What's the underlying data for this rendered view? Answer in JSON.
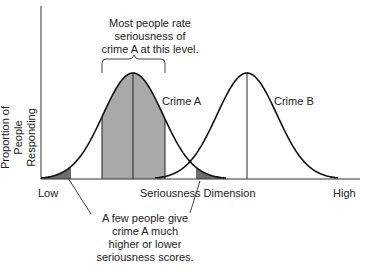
{
  "annotations": {
    "top_note": [
      "Most people rate",
      "seriousness of",
      "crime A at this level."
    ],
    "bottom_note": [
      "A few people give",
      "crime A much",
      "higher or lower",
      "seriousness scores."
    ]
  },
  "axes": {
    "ylabel_line1": "Proportion of People",
    "ylabel_line2": "Responding",
    "x_low": "Low",
    "x_mid": "Seriousness Dimension",
    "x_high": "High"
  },
  "curves": {
    "a_label": "Crime A",
    "b_label": "Crime B"
  },
  "colors": {
    "line": "#111111",
    "center_fill": "#a9a9a9",
    "tail_fill": "#6e6e6e"
  },
  "chart_data": {
    "type": "area",
    "title": "",
    "xlabel": "Seriousness Dimension",
    "ylabel": "Proportion of People Responding",
    "x_tick_labels": [
      "Low",
      "High"
    ],
    "series": [
      {
        "name": "Crime A",
        "distribution": "normal",
        "mean_relative": 0.29,
        "shaded_center": true,
        "shaded_tails": true
      },
      {
        "name": "Crime B",
        "distribution": "normal",
        "mean_relative": 0.64,
        "shaded_center": false,
        "shaded_tails": false
      }
    ],
    "grid": false,
    "legend": "none"
  }
}
